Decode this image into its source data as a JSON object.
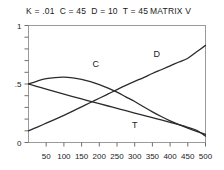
{
  "header": {
    "parameters": "K = .01  C = 45  D = 10  T = 45",
    "matrix_label": "MATRIX V"
  },
  "chart_data": {
    "type": "line",
    "title": "K = .01  C = 45  D = 10  T = 45    MATRIX V",
    "xlabel": "",
    "ylabel": "",
    "xlim": [
      0,
      500
    ],
    "ylim": [
      0,
      1
    ],
    "grid": false,
    "legend": "inline-curve-labels",
    "x_tick_labels": [
      "50",
      "100",
      "150",
      "200",
      "250",
      "300",
      "350",
      "400",
      "450",
      "500"
    ],
    "x_tick_values": [
      50,
      100,
      150,
      200,
      250,
      300,
      350,
      400,
      450,
      500
    ],
    "x_minor_step": 50,
    "y_tick_labels": [
      "0",
      ".5",
      "1"
    ],
    "y_tick_values": [
      0,
      0.5,
      1
    ],
    "y_minor_step": 0.1,
    "x": [
      0,
      25,
      50,
      75,
      100,
      125,
      150,
      175,
      200,
      225,
      250,
      275,
      300,
      325,
      350,
      375,
      400,
      425,
      450,
      475,
      500
    ],
    "series": [
      {
        "name": "C",
        "label": "C",
        "label_x": 190,
        "label_y": 0.645,
        "values": [
          0.5,
          0.525,
          0.545,
          0.555,
          0.558,
          0.552,
          0.54,
          0.52,
          0.495,
          0.465,
          0.43,
          0.39,
          0.35,
          0.305,
          0.262,
          0.222,
          0.185,
          0.152,
          0.122,
          0.095,
          0.07
        ]
      },
      {
        "name": "D",
        "label": "D",
        "label_x": 362,
        "label_y": 0.73,
        "values": [
          0.1,
          0.132,
          0.165,
          0.198,
          0.232,
          0.268,
          0.305,
          0.342,
          0.378,
          0.415,
          0.452,
          0.488,
          0.522,
          0.555,
          0.59,
          0.622,
          0.655,
          0.688,
          0.72,
          0.775,
          0.83
        ]
      },
      {
        "name": "T",
        "label": "T",
        "label_x": 300,
        "label_y": 0.12,
        "values": [
          0.5,
          0.478,
          0.456,
          0.435,
          0.414,
          0.393,
          0.372,
          0.352,
          0.332,
          0.312,
          0.292,
          0.272,
          0.252,
          0.232,
          0.212,
          0.193,
          0.173,
          0.152,
          0.13,
          0.105,
          0.055
        ]
      }
    ]
  },
  "colors": {
    "curve": "#2b2b2b",
    "frame": "#9a9a9a",
    "tick": "#6e6e6e",
    "text": "#1a1a1a",
    "background": "#ffffff"
  }
}
